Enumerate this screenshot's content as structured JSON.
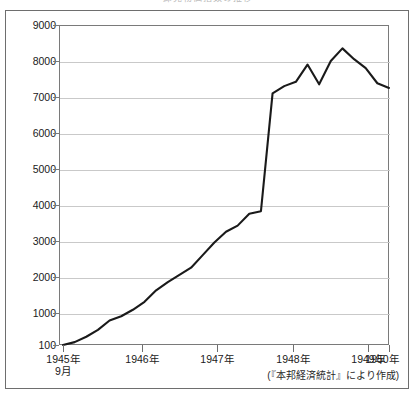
{
  "chart_title": "卸売物価指数の推移",
  "source_note": "(『本邦経済統計』により作成)",
  "axis": {
    "y_ticks": [
      "9000",
      "8000",
      "7000",
      "6000",
      "5000",
      "4000",
      "3000",
      "2000",
      "1000",
      "100"
    ],
    "x_ticks": [
      {
        "label": "1945年",
        "sub": "9月"
      },
      {
        "label": "1946年",
        "sub": ""
      },
      {
        "label": "1947年",
        "sub": ""
      },
      {
        "label": "1948年",
        "sub": ""
      },
      {
        "label": "1949年",
        "sub": ""
      },
      {
        "label": "1950年",
        "sub": ""
      }
    ]
  },
  "chart_data": {
    "type": "line",
    "title": "卸売物価指数の推移",
    "xlabel": "",
    "ylabel": "",
    "ylim": [
      100,
      9000
    ],
    "ytick_values": [
      100,
      1000,
      2000,
      3000,
      4000,
      5000,
      6000,
      7000,
      8000,
      9000
    ],
    "grid": true,
    "legend": null,
    "annotations": [
      "(『本邦経済統計』により作成)"
    ],
    "xlim": [
      "1945-09",
      "1950-06"
    ],
    "x_tick_labels": [
      "1945年9月",
      "1946年",
      "1947年",
      "1948年",
      "1949年",
      "1950年"
    ],
    "series": [
      {
        "name": "卸売物価指数",
        "x": [
          "1945-09",
          "1945-11",
          "1946-01",
          "1946-03",
          "1946-05",
          "1946-07",
          "1946-09",
          "1946-11",
          "1947-01",
          "1947-03",
          "1947-05",
          "1947-07",
          "1947-09",
          "1947-11",
          "1948-01",
          "1948-03",
          "1948-05",
          "1948-07",
          "1948-09",
          "1948-11",
          "1949-01",
          "1949-03",
          "1949-05",
          "1949-07",
          "1949-09",
          "1949-11",
          "1950-01",
          "1950-03",
          "1950-05"
        ],
        "values": [
          100,
          180,
          330,
          520,
          780,
          900,
          1080,
          1300,
          1620,
          1850,
          2050,
          2250,
          2600,
          2950,
          3250,
          3420,
          3750,
          3820,
          7100,
          7300,
          7420,
          7900,
          7350,
          8000,
          8350,
          8050,
          7800,
          7380,
          7250
        ]
      }
    ]
  }
}
